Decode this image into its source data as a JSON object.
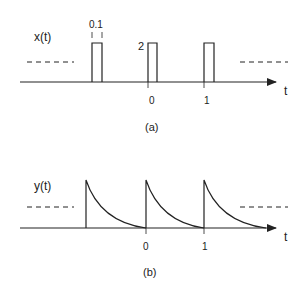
{
  "panel_a": {
    "signal_label": "x(t)",
    "width_label": "0.1",
    "height_label": "2",
    "axis_label": "t",
    "tick_labels": [
      "0",
      "1"
    ],
    "caption": "(a)"
  },
  "panel_b": {
    "signal_label": "y(t)",
    "axis_label": "t",
    "tick_labels": [
      "0",
      "1"
    ],
    "caption": "(b)"
  },
  "colors": {
    "ink": "#222222",
    "background": "#ffffff"
  }
}
